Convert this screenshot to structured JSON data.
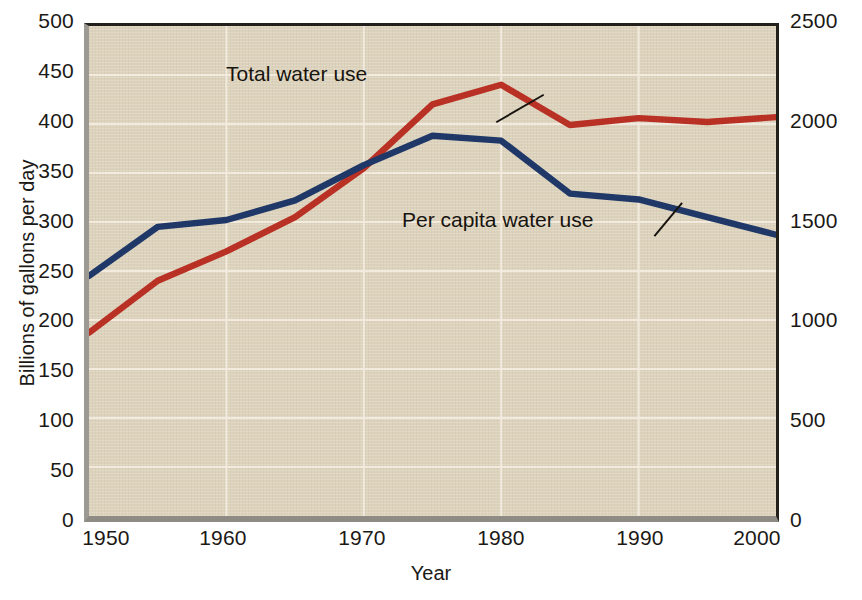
{
  "chart_data": {
    "type": "line",
    "title": "",
    "xlabel": "Year",
    "ylabel": "Billions of gallons per day",
    "ylabel_right": "Gallons per person per day",
    "x": [
      1950,
      1955,
      1960,
      1965,
      1970,
      1975,
      1980,
      1985,
      1990,
      1995,
      2000
    ],
    "xlim": [
      1950,
      2000
    ],
    "ylim": [
      0,
      500
    ],
    "ylim_right": [
      0,
      2500
    ],
    "xticks": [
      1950,
      1960,
      1970,
      1980,
      1990,
      2000
    ],
    "xtick_labels": [
      "1950",
      "1960",
      "1970",
      "1980",
      "1990",
      "2000"
    ],
    "yticks": [
      0,
      50,
      100,
      150,
      200,
      250,
      300,
      350,
      400,
      450,
      500
    ],
    "ytick_labels": [
      "0",
      "50",
      "100",
      "150",
      "200",
      "250",
      "300",
      "350",
      "400",
      "450",
      "500"
    ],
    "yticks_right": [
      0,
      500,
      1000,
      1500,
      2000,
      2500
    ],
    "ytick_labels_right": [
      "0",
      "500",
      "1000",
      "1500",
      "2000",
      "2500"
    ],
    "grid": true,
    "grid_color": "#f4ece0",
    "plot_background": "#ddd3bd",
    "legend": "in-plot annotated labels with leader lines",
    "series": [
      {
        "name": "Total water use",
        "axis": "left",
        "units": "billions of gallons per day",
        "color": "#b93024",
        "values": [
          187,
          240,
          270,
          305,
          355,
          420,
          440,
          399,
          406,
          402,
          407
        ]
      },
      {
        "name": "Per capita water use",
        "axis": "right",
        "units": "gallons per person per day",
        "color": "#1f3867",
        "values_left_scale": [
          245,
          295,
          302,
          322,
          358,
          388,
          383,
          329,
          323,
          305,
          287
        ],
        "values": [
          1225,
          1475,
          1510,
          1610,
          1790,
          1940,
          1915,
          1645,
          1615,
          1525,
          1435
        ]
      }
    ],
    "annotations": [
      {
        "text": "Total water use",
        "target_x": 1973,
        "target_y": 375
      },
      {
        "text": "Per capita water use",
        "target_x": 1979,
        "target_y": 355
      }
    ]
  },
  "axes": {
    "x_axis_title": "Year",
    "y_axis_left_title": "Billions of gallons per day",
    "y_axis_right_title": "Gallons per person per day"
  },
  "caption": ""
}
